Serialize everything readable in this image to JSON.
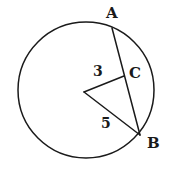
{
  "figure": {
    "kind": "circle-geometry-diagram",
    "background_color": "#ffffff",
    "stroke_color": "#1a1a1a",
    "label_color": "#1a1a1a",
    "canvas": {
      "width": 170,
      "height": 170
    },
    "circle": {
      "name": "main-circle",
      "center_x": 86,
      "center_y": 90,
      "radius": 68
    },
    "points": {
      "A": {
        "label": "A",
        "x": 112,
        "y": 28,
        "on": "circle"
      },
      "B": {
        "label": "B",
        "x": 140,
        "y": 135,
        "on": "circle"
      },
      "C": {
        "label": "C",
        "x": 124,
        "y": 76,
        "on": "chord-AB"
      },
      "O": {
        "label": "",
        "x": 84,
        "y": 92,
        "on": "center"
      }
    },
    "segments": [
      {
        "name": "chord-AB",
        "from": "A",
        "to": "B",
        "label": ""
      },
      {
        "name": "segment-OC",
        "from": "O",
        "to": "C",
        "label": "3"
      },
      {
        "name": "segment-OB",
        "from": "O",
        "to": "B",
        "label": "5"
      }
    ],
    "measures": {
      "oc_length": "3",
      "ob_length": "5"
    }
  },
  "labels": {
    "point_a": "A",
    "point_b": "B",
    "point_c": "C",
    "length_three": "3",
    "length_five": "5"
  }
}
